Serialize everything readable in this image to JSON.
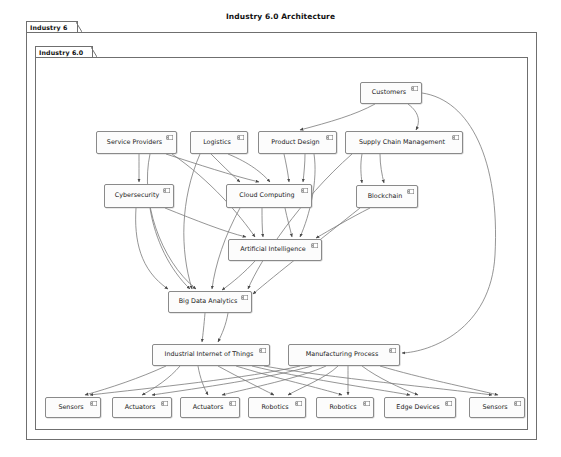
{
  "title": "Industry 6.0 Architecture",
  "packages": [
    {
      "name": "outer-package",
      "label": "Industry 6",
      "x": 26,
      "y": 32,
      "w": 511,
      "h": 408,
      "tab_w": 52,
      "tab_h": 11
    },
    {
      "name": "inner-package",
      "label": "Industry 6.0",
      "x": 35,
      "y": 57,
      "w": 493,
      "h": 373,
      "tab_w": 58,
      "tab_h": 11
    }
  ],
  "icon": {
    "name": "uml-component-icon"
  },
  "nodes": [
    {
      "id": "customers",
      "label": "Customers",
      "x": 360,
      "y": 82,
      "w": 62,
      "h": 22
    },
    {
      "id": "service",
      "label": "Service Providers",
      "x": 96,
      "y": 131,
      "w": 81,
      "h": 23
    },
    {
      "id": "logistics",
      "label": "Logistics",
      "x": 190,
      "y": 131,
      "w": 58,
      "h": 23
    },
    {
      "id": "design",
      "label": "Product Design",
      "x": 258,
      "y": 131,
      "w": 79,
      "h": 23
    },
    {
      "id": "supply",
      "label": "Supply Chain Management",
      "x": 345,
      "y": 131,
      "w": 118,
      "h": 23
    },
    {
      "id": "cyber",
      "label": "Cybersecurity",
      "x": 104,
      "y": 184,
      "w": 70,
      "h": 24
    },
    {
      "id": "cloud",
      "label": "Cloud Computing",
      "x": 226,
      "y": 184,
      "w": 86,
      "h": 24
    },
    {
      "id": "blockchain",
      "label": "Blockchain",
      "x": 356,
      "y": 185,
      "w": 62,
      "h": 23
    },
    {
      "id": "ai",
      "label": "Artificial Intelligence",
      "x": 228,
      "y": 239,
      "w": 94,
      "h": 22
    },
    {
      "id": "bigdata",
      "label": "Big Data Analytics",
      "x": 168,
      "y": 291,
      "w": 84,
      "h": 22
    },
    {
      "id": "iiot",
      "label": "Industrial Internet of Things",
      "x": 152,
      "y": 344,
      "w": 118,
      "h": 22
    },
    {
      "id": "mfg",
      "label": "Manufacturing Process",
      "x": 288,
      "y": 344,
      "w": 112,
      "h": 22
    },
    {
      "id": "sensors1",
      "label": "Sensors",
      "x": 45,
      "y": 397,
      "w": 56,
      "h": 21
    },
    {
      "id": "actuators1",
      "label": "Actuators",
      "x": 112,
      "y": 397,
      "w": 60,
      "h": 21
    },
    {
      "id": "actuators2",
      "label": "Actuators",
      "x": 180,
      "y": 397,
      "w": 60,
      "h": 21
    },
    {
      "id": "robotics1",
      "label": "Robotics",
      "x": 248,
      "y": 397,
      "w": 58,
      "h": 21
    },
    {
      "id": "robotics2",
      "label": "Robotics",
      "x": 316,
      "y": 397,
      "w": 58,
      "h": 21
    },
    {
      "id": "edge",
      "label": "Edge Devices",
      "x": 384,
      "y": 397,
      "w": 72,
      "h": 21
    },
    {
      "id": "sensors2",
      "label": "Sensors",
      "x": 469,
      "y": 397,
      "w": 56,
      "h": 21
    }
  ],
  "edges": [
    {
      "from": "customers",
      "to": "design",
      "path": "M 375 104 C 355 115, 330 122, 300 130"
    },
    {
      "from": "customers",
      "to": "supply",
      "path": "M 408 104 C 420 113, 420 122, 416 130"
    },
    {
      "from": "customers",
      "to": "mfg",
      "path": "M 422 93 C 470 100, 500 160, 495 255 C 491 330, 430 352, 402 353"
    },
    {
      "from": "service",
      "to": "cyber",
      "path": "M 139 154 C 139 165, 139 172, 139 182"
    },
    {
      "from": "service",
      "to": "cloud",
      "path": "M 166 154 C 200 165, 230 175, 259 182"
    },
    {
      "from": "service",
      "to": "ai",
      "path": "M 172 154 C 210 180, 240 215, 255 237"
    },
    {
      "from": "service",
      "to": "bigdata",
      "path": "M 150 154 C 140 200, 160 260, 196 289"
    },
    {
      "from": "logistics",
      "to": "cloud",
      "path": "M 211 154 C 220 163, 230 173, 240 182"
    },
    {
      "from": "logistics",
      "to": "cloud",
      "path": "M 228 154 C 250 163, 262 173, 270 182"
    },
    {
      "from": "logistics",
      "to": "bigdata",
      "path": "M 200 154 C 180 200, 180 250, 192 289"
    },
    {
      "from": "design",
      "to": "cloud",
      "path": "M 284 154 C 286 163, 288 173, 289 182"
    },
    {
      "from": "design",
      "to": "cloud",
      "path": "M 305 154 C 305 163, 304 173, 303 182"
    },
    {
      "from": "design",
      "to": "ai",
      "path": "M 314 154 C 318 180, 310 215, 300 237"
    },
    {
      "from": "supply",
      "to": "blockchain",
      "path": "M 380 154 C 380 165, 382 175, 384 183"
    },
    {
      "from": "supply",
      "to": "blockchain",
      "path": "M 362 154 C 360 165, 361 175, 362 183"
    },
    {
      "from": "supply",
      "to": "bigdata",
      "path": "M 352 154 C 300 200, 260 260, 248 289"
    },
    {
      "from": "cyber",
      "to": "bigdata",
      "path": "M 136 208 C 134 240, 140 270, 168 289"
    },
    {
      "from": "cyber",
      "to": "ai",
      "path": "M 165 208 C 195 220, 225 232, 246 237"
    },
    {
      "from": "cyber",
      "to": "bigdata",
      "path": "M 150 208 C 155 240, 170 270, 190 289"
    },
    {
      "from": "cloud",
      "to": "ai",
      "path": "M 262 208 C 262 218, 262 228, 263 237"
    },
    {
      "from": "cloud",
      "to": "ai",
      "path": "M 285 208 C 287 218, 290 228, 292 237"
    },
    {
      "from": "cloud",
      "to": "bigdata",
      "path": "M 240 208 C 225 235, 215 265, 212 289"
    },
    {
      "from": "blockchain",
      "to": "ai",
      "path": "M 370 208 C 350 218, 330 230, 316 238"
    },
    {
      "from": "blockchain",
      "to": "bigdata",
      "path": "M 360 208 C 320 240, 275 275, 253 294"
    },
    {
      "from": "ai",
      "to": "bigdata",
      "path": "M 255 261 C 245 272, 232 283, 222 290"
    },
    {
      "from": "bigdata",
      "to": "iiot",
      "path": "M 205 313 C 204 325, 203 334, 202 342"
    },
    {
      "from": "bigdata",
      "to": "iiot",
      "path": "M 228 313 C 226 325, 222 334, 218 342"
    },
    {
      "from": "iiot",
      "to": "sensors1",
      "path": "M 166 366 C 140 378, 110 388, 85 395"
    },
    {
      "from": "iiot",
      "to": "actuators1",
      "path": "M 180 366 C 170 378, 155 388, 142 395"
    },
    {
      "from": "iiot",
      "to": "actuators2",
      "path": "M 198 366 C 200 378, 204 388, 208 395"
    },
    {
      "from": "iiot",
      "to": "robotics1",
      "path": "M 218 366 C 240 378, 260 388, 274 395"
    },
    {
      "from": "iiot",
      "to": "robotics2",
      "path": "M 236 366 C 275 378, 320 388, 342 395"
    },
    {
      "from": "iiot",
      "to": "edge",
      "path": "M 252 366 C 300 378, 370 388, 410 395"
    },
    {
      "from": "iiot",
      "to": "sensors2",
      "path": "M 264 366 C 330 378, 440 388, 492 395"
    },
    {
      "from": "mfg",
      "to": "sensors1",
      "path": "M 300 366 C 250 378, 150 388, 90 395"
    },
    {
      "from": "mfg",
      "to": "actuators1",
      "path": "M 312 366 C 270 378, 200 388, 152 395"
    },
    {
      "from": "mfg",
      "to": "actuators2",
      "path": "M 326 366 C 300 378, 250 388, 222 395"
    },
    {
      "from": "mfg",
      "to": "robotics1",
      "path": "M 338 366 C 326 378, 300 388, 288 395"
    },
    {
      "from": "mfg",
      "to": "robotics2",
      "path": "M 348 366 C 348 378, 348 388, 348 395"
    },
    {
      "from": "mfg",
      "to": "edge",
      "path": "M 362 366 C 378 378, 400 388, 418 395"
    },
    {
      "from": "mfg",
      "to": "sensors2",
      "path": "M 380 366 C 420 378, 470 388, 498 395"
    }
  ]
}
